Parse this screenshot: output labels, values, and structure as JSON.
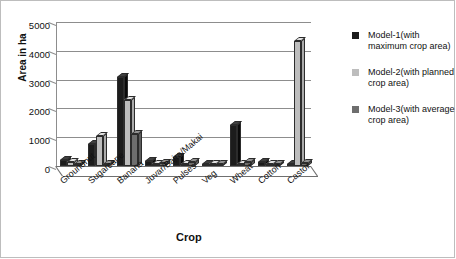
{
  "chart_data": {
    "type": "bar",
    "title": "",
    "xlabel": "Crop",
    "ylabel": "Area in ha",
    "ylim": [
      0,
      5000
    ],
    "ytick_values": [
      0,
      1000,
      2000,
      3000,
      4000,
      5000
    ],
    "ytick_labels": [
      "0",
      "1000",
      "2000",
      "3000",
      "4000",
      "5000"
    ],
    "grid": "horizontal",
    "legend_position": "right",
    "style": "3d-clustered-column",
    "categories": [
      "Groundnut",
      "Sugarcane",
      "Banana",
      "Juvar/Bajra/Makai",
      "Pulses",
      "Veg",
      "Wheat",
      "Cotton",
      "Castor"
    ],
    "series": [
      {
        "name": "Model-1(with maximum crop area)",
        "color": "#1c1c1c",
        "values": [
          210,
          780,
          3080,
          170,
          300,
          55,
          1430,
          130,
          60
        ]
      },
      {
        "name": "Model-2(with planned crop area)",
        "color": "#bdbdbd",
        "values": [
          130,
          1040,
          2280,
          60,
          40,
          40,
          40,
          35,
          4350
        ]
      },
      {
        "name": "Model-3(with average crop area)",
        "color": "#6e6e6e",
        "values": [
          60,
          70,
          1100,
          110,
          150,
          50,
          140,
          70,
          100
        ]
      }
    ]
  },
  "legend": {
    "items": [
      {
        "label": "Model-1(with maximum crop area)",
        "color": "#1c1c1c"
      },
      {
        "label": "Model-2(with planned crop area)",
        "color": "#bdbdbd"
      },
      {
        "label": "Model-3(with average crop area)",
        "color": "#6e6e6e"
      }
    ]
  }
}
